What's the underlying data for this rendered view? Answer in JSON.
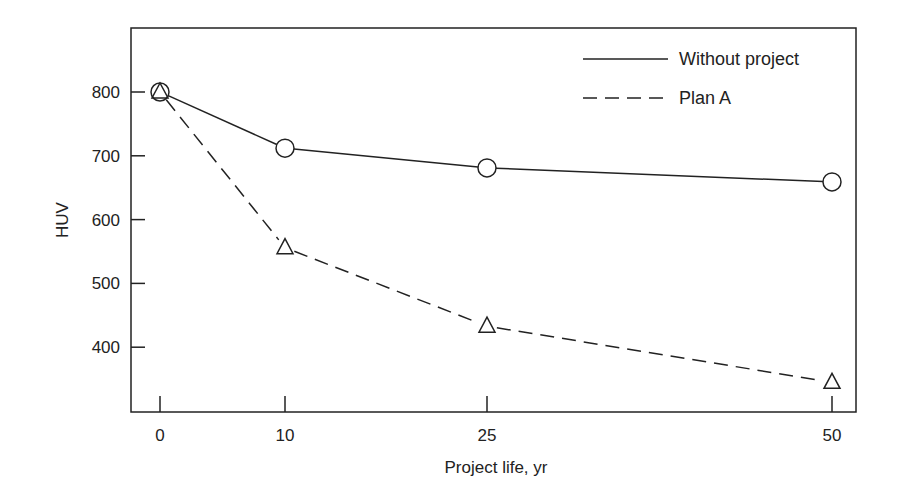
{
  "chart_data": {
    "type": "line",
    "title": "",
    "xlabel": "Project life, yr",
    "ylabel": "HUV",
    "x": [
      0,
      10,
      25,
      50
    ],
    "x_tick_labels": [
      "0",
      "10",
      "25",
      "50"
    ],
    "y_ticks": [
      400,
      500,
      600,
      700,
      800
    ],
    "y_tick_labels": [
      "400",
      "500",
      "600",
      "700",
      "800"
    ],
    "ylim": [
      310,
      900
    ],
    "grid": false,
    "legend_position": "upper right",
    "series": [
      {
        "name": "Without project",
        "values": [
          800,
          712,
          681,
          659
        ],
        "line_style": "solid",
        "marker": "circle",
        "color": "#222222"
      },
      {
        "name": "Plan A",
        "values": [
          800,
          556,
          433,
          345
        ],
        "line_style": "dashed",
        "marker": "triangle",
        "color": "#222222"
      }
    ]
  },
  "legend": {
    "items": [
      {
        "label": "Without project"
      },
      {
        "label": "Plan A"
      }
    ]
  }
}
